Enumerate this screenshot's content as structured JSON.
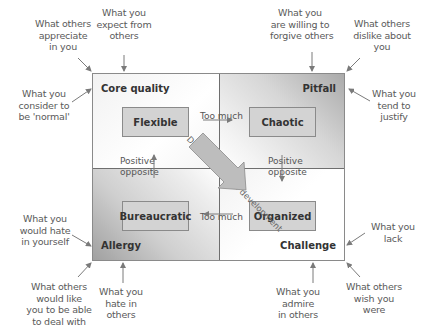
{
  "quadrants": {
    "core_quality": {
      "label": "Core quality",
      "example": "Flexible"
    },
    "pitfall": {
      "label": "Pitfall",
      "example": "Chaotic"
    },
    "allergy": {
      "label": "Allergy",
      "example": "Bureaucratic"
    },
    "challenge": {
      "label": "Challenge",
      "example": "Organized"
    }
  },
  "relations": {
    "too_much_top": "Too much",
    "too_much_bottom": "Too much",
    "positive_opposite_left": [
      "Positive",
      "opposite"
    ],
    "positive_opposite_right": [
      "Positive",
      "opposite"
    ],
    "diagonal": "Desired personal development"
  },
  "annotations": {
    "core_quality": [
      [
        "What others",
        "appreciate",
        "in you"
      ],
      [
        "What you",
        "expect from",
        "others"
      ],
      [
        "What you",
        "consider to",
        "be 'normal'"
      ]
    ],
    "pitfall": [
      [
        "What you",
        "are willing to",
        "forgive others"
      ],
      [
        "What others",
        "dislike about",
        "you"
      ],
      [
        "What you",
        "tend to",
        "justify"
      ]
    ],
    "allergy": [
      [
        "What you",
        "would hate",
        "in yourself"
      ],
      [
        "What others",
        "would like",
        "you to be able",
        "to deal with"
      ],
      [
        "What you",
        "hate in",
        "others"
      ]
    ],
    "challenge": [
      [
        "What you",
        "lack"
      ],
      [
        "What others",
        "wish you",
        "were"
      ],
      [
        "What you",
        "admire",
        "in others"
      ]
    ]
  },
  "colors": {
    "box_fill": "#d3d3d3",
    "border": "#8a8a8a",
    "arrow": "#7a7a7a",
    "text": "#5a5a5a"
  }
}
